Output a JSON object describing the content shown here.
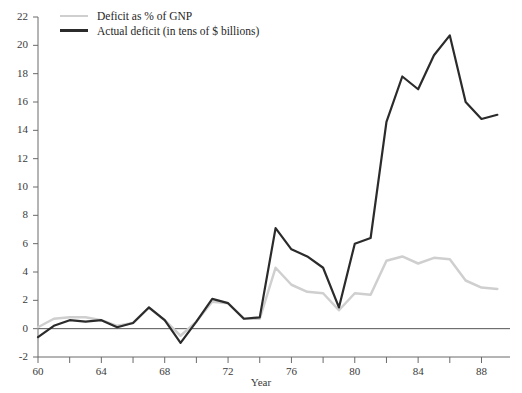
{
  "chart_data": {
    "type": "line",
    "title": "",
    "subtitle": "",
    "xlabel": "Year",
    "ylabel": "",
    "xlim": [
      60,
      89.8
    ],
    "ylim": [
      -2,
      22
    ],
    "grid": false,
    "legend_position": "top-left",
    "x_major_ticks": [
      60,
      64,
      68,
      72,
      76,
      80,
      84,
      88
    ],
    "x_minor_ticks": [
      62,
      66,
      70,
      74,
      78,
      82,
      86
    ],
    "x_tick_labels": [
      "60",
      "64",
      "68",
      "72",
      "76",
      "80",
      "84",
      "88"
    ],
    "y_ticks": [
      -2,
      0,
      2,
      4,
      6,
      8,
      10,
      12,
      14,
      16,
      18,
      20,
      22
    ],
    "y_tick_labels": [
      "-2",
      "0",
      "2",
      "4",
      "6",
      "8",
      "10",
      "12",
      "14",
      "16",
      "18",
      "20",
      "22"
    ],
    "zero_line": 0,
    "x": [
      60,
      61,
      62,
      63,
      64,
      65,
      66,
      67,
      68,
      69,
      70,
      71,
      72,
      73,
      74,
      75,
      76,
      77,
      78,
      79,
      80,
      81,
      82,
      83,
      84,
      85,
      86,
      87,
      88,
      89
    ],
    "series": [
      {
        "name": "Deficit as % of GNP",
        "color": "#cfcfcf",
        "width": 2.5,
        "values": [
          0.1,
          0.7,
          0.8,
          0.8,
          0.6,
          0.2,
          0.4,
          1.5,
          0.6,
          -0.5,
          0.5,
          1.9,
          1.8,
          0.7,
          0.7,
          4.3,
          3.1,
          2.6,
          2.5,
          1.3,
          2.5,
          2.4,
          4.8,
          5.1,
          4.6,
          5.0,
          4.9,
          3.4,
          2.9,
          2.8
        ]
      },
      {
        "name": "Actual deficit (in tens of $ billions)",
        "color": "#2b2b2b",
        "width": 2.2,
        "values": [
          -0.6,
          0.2,
          0.6,
          0.5,
          0.6,
          0.1,
          0.4,
          1.5,
          0.6,
          -1.0,
          0.5,
          2.1,
          1.8,
          0.7,
          0.8,
          7.1,
          5.6,
          5.1,
          4.3,
          1.5,
          6.0,
          6.4,
          14.6,
          17.8,
          16.9,
          19.3,
          20.7,
          16.0,
          14.8,
          15.1
        ]
      }
    ],
    "annotations": []
  },
  "legend": {
    "items": [
      {
        "label": "Deficit as % of GNP",
        "style": "gnp"
      },
      {
        "label": "Actual deficit (in tens of $ billions)",
        "style": "actual"
      }
    ]
  },
  "axes": {
    "x_title": "Year"
  }
}
